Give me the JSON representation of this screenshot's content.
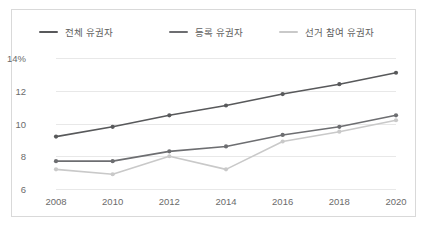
{
  "chart_data": {
    "type": "line",
    "title": "",
    "xlabel": "",
    "ylabel": "",
    "categories": [
      "2008",
      "2010",
      "2012",
      "2014",
      "2016",
      "2018",
      "2020"
    ],
    "x": [
      2008,
      2010,
      2012,
      2014,
      2016,
      2018,
      2020
    ],
    "ylim": [
      6,
      14
    ],
    "yticks": [
      6,
      8,
      10,
      12,
      14
    ],
    "ytick_labels": [
      "6",
      "8",
      "10",
      "12",
      "14%"
    ],
    "grid": true,
    "legend_position": "top",
    "series": [
      {
        "name": "전체 유권자",
        "color": "#58595b",
        "values": [
          9.2,
          9.8,
          10.5,
          11.1,
          11.8,
          12.4,
          13.1
        ]
      },
      {
        "name": "등록 유권자",
        "color": "#6d6e71",
        "values": [
          7.7,
          7.7,
          8.3,
          8.6,
          9.3,
          9.8,
          10.5
        ]
      },
      {
        "name": "선거 참여 유권자",
        "color": "#c9c9c9",
        "values": [
          7.2,
          6.9,
          8.0,
          7.2,
          8.9,
          9.5,
          10.2
        ]
      }
    ]
  },
  "style": {
    "card_border": "#d9d9d9",
    "gridline_color": "#e8e8e8",
    "axis_color": "#c8c8c8",
    "tick_text_color": "#6b6b6b",
    "legend_text_color": "#606060"
  },
  "legend": {
    "items": [
      {
        "label": "전체 유권자",
        "color": "#58595b",
        "left": 27
      },
      {
        "label": "등록 유권자",
        "color": "#6d6e71",
        "left": 157
      },
      {
        "label": "선거 참여 유권자",
        "color": "#c9c9c9",
        "left": 267
      }
    ]
  }
}
